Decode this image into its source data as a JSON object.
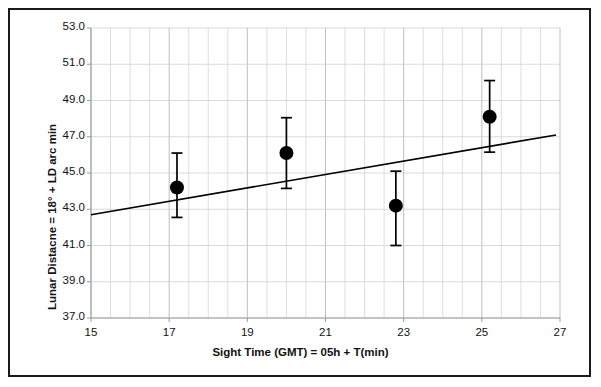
{
  "chart_data": {
    "type": "scatter",
    "title": "",
    "xlabel": "Sight Time (GMT) = 05h + T(min)",
    "ylabel": "Lunar Distacne = 18° + LD arc min",
    "xlim": [
      15,
      27
    ],
    "ylim": [
      37.0,
      53.0
    ],
    "xticks": [
      "15",
      "17",
      "19",
      "21",
      "23",
      "25",
      "27"
    ],
    "xtick_values": [
      15,
      17,
      19,
      21,
      23,
      25,
      27
    ],
    "yticks": [
      "37.0",
      "39.0",
      "41.0",
      "43.0",
      "45.0",
      "47.0",
      "49.0",
      "51.0",
      "53.0"
    ],
    "ytick_values": [
      37.0,
      39.0,
      41.0,
      43.0,
      45.0,
      47.0,
      49.0,
      51.0,
      53.0
    ],
    "x_minor_step": 0.5,
    "grid": "major-horizontal-and-minor-vertical",
    "legend": "none",
    "marker": "filled-circle",
    "marker_color": "#000000",
    "line_color": "#000000",
    "grid_color": "#d0d0d0",
    "points": [
      {
        "x": 17.2,
        "y": 44.2,
        "yerr_low": 42.55,
        "yerr_high": 46.1
      },
      {
        "x": 20.0,
        "y": 46.1,
        "yerr_low": 44.15,
        "yerr_high": 48.05
      },
      {
        "x": 22.8,
        "y": 43.2,
        "yerr_low": 41.0,
        "yerr_high": 45.1
      },
      {
        "x": 25.2,
        "y": 48.1,
        "yerr_low": 46.15,
        "yerr_high": 50.1
      }
    ],
    "trendline": {
      "x0": 15.0,
      "y0": 42.7,
      "x1": 26.9,
      "y1": 47.1
    }
  }
}
